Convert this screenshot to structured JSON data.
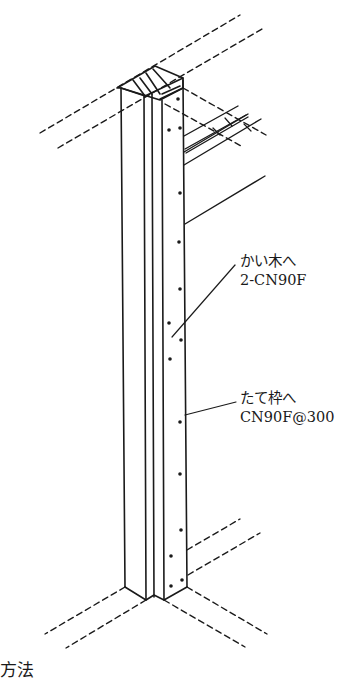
{
  "diagram": {
    "type": "isometric-construction-detail",
    "colors": {
      "line": "#1a1a1a",
      "background": "#ffffff"
    }
  },
  "annotations": [
    {
      "id": "blocking",
      "line1": "かい木へ",
      "line2": "2-CN90F"
    },
    {
      "id": "stud",
      "line1": "たて枠へ",
      "line2": "CN90F@300"
    }
  ],
  "caption": {
    "text": "方法"
  }
}
